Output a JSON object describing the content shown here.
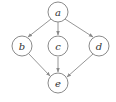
{
  "diagram": {
    "type": "directed-graph",
    "nodes": [
      {
        "id": "a",
        "label": "a",
        "x": 58,
        "y": 12
      },
      {
        "id": "b",
        "label": "b",
        "x": 22,
        "y": 46
      },
      {
        "id": "c",
        "label": "c",
        "x": 58,
        "y": 46
      },
      {
        "id": "d",
        "label": "d",
        "x": 99,
        "y": 46
      },
      {
        "id": "e",
        "label": "e",
        "x": 58,
        "y": 83
      }
    ],
    "edges": [
      {
        "from": "a",
        "to": "b"
      },
      {
        "from": "a",
        "to": "c"
      },
      {
        "from": "a",
        "to": "d"
      },
      {
        "from": "b",
        "to": "e"
      },
      {
        "from": "c",
        "to": "e"
      },
      {
        "from": "d",
        "to": "e"
      }
    ],
    "colors": {
      "stroke": "#8a8a8a",
      "text": "#333333",
      "background": "#ffffff"
    }
  }
}
